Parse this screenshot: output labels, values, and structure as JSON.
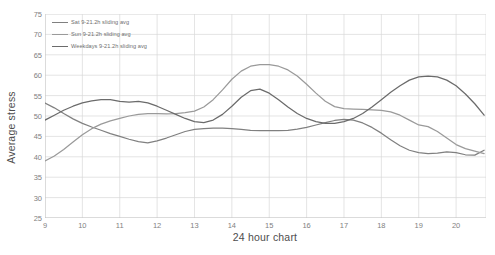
{
  "chart_data": {
    "type": "line",
    "title": "",
    "xlabel": "24 hour chart",
    "ylabel": "Average stress",
    "xlim": [
      9,
      20.8
    ],
    "ylim": [
      25,
      75
    ],
    "ytick_step": 5,
    "grid": true,
    "legend_position": "top-left-inside",
    "xticks": [
      "9",
      "10",
      "11",
      "12",
      "13",
      "14",
      "15",
      "16",
      "17",
      "18",
      "19",
      "20"
    ],
    "yticks": [
      "25",
      "30",
      "35",
      "40",
      "45",
      "50",
      "55",
      "60",
      "65",
      "70",
      "75"
    ],
    "x": [
      9,
      9.25,
      9.5,
      9.75,
      10,
      10.25,
      10.5,
      10.75,
      11,
      11.25,
      11.5,
      11.75,
      12,
      12.25,
      12.5,
      12.75,
      13,
      13.25,
      13.5,
      13.75,
      14,
      14.25,
      14.5,
      14.75,
      15,
      15.25,
      15.5,
      15.75,
      16,
      16.25,
      16.5,
      16.75,
      17,
      17.25,
      17.5,
      17.75,
      18,
      18.25,
      18.5,
      18.75,
      19,
      19.25,
      19.5,
      19.75,
      20,
      20.25,
      20.5,
      20.75
    ],
    "series": [
      {
        "name": "Sat 9-21.2h sliding avg",
        "color": "#808080",
        "values": [
          53.2,
          52.0,
          50.6,
          49.3,
          48.2,
          47.3,
          46.5,
          45.7,
          45.0,
          44.3,
          43.7,
          43.4,
          43.9,
          44.6,
          45.4,
          46.2,
          46.7,
          46.9,
          47.0,
          47.0,
          46.9,
          46.7,
          46.5,
          46.4,
          46.4,
          46.4,
          46.5,
          46.8,
          47.2,
          47.8,
          48.4,
          48.9,
          49.2,
          49.0,
          48.3,
          47.2,
          45.8,
          44.2,
          42.7,
          41.6,
          41.0,
          40.8,
          40.9,
          41.2,
          41.0,
          40.5,
          40.4,
          41.6
        ]
      },
      {
        "name": "Sun 9-21.2h sliding avg",
        "color": "#9a9a9a",
        "values": [
          39.0,
          40.2,
          41.8,
          43.6,
          45.4,
          46.9,
          48.0,
          48.8,
          49.4,
          50.0,
          50.4,
          50.6,
          50.6,
          50.5,
          50.6,
          50.8,
          51.2,
          52.2,
          54.0,
          56.4,
          59.0,
          61.0,
          62.2,
          62.6,
          62.6,
          62.2,
          61.3,
          59.8,
          57.8,
          55.6,
          53.6,
          52.3,
          51.8,
          51.7,
          51.6,
          51.5,
          51.4,
          51.0,
          50.2,
          49.0,
          47.8,
          47.4,
          46.2,
          44.6,
          43.0,
          42.0,
          41.4,
          40.8
        ]
      },
      {
        "name": "Weekdays 9-21.2h sliding avg",
        "color": "#6b6b6b",
        "values": [
          49.0,
          50.2,
          51.4,
          52.4,
          53.2,
          53.7,
          54.0,
          54.0,
          53.6,
          53.4,
          53.6,
          53.2,
          52.4,
          51.4,
          50.4,
          49.4,
          48.6,
          48.4,
          49.0,
          50.4,
          52.4,
          54.6,
          56.2,
          56.6,
          55.6,
          54.0,
          52.2,
          50.6,
          49.4,
          48.6,
          48.2,
          48.2,
          48.6,
          49.4,
          50.6,
          52.2,
          54.0,
          55.8,
          57.4,
          58.8,
          59.6,
          59.8,
          59.6,
          58.8,
          57.4,
          55.4,
          53.0,
          50.2
        ]
      }
    ]
  },
  "legend": {
    "items": [
      {
        "label": "Sat 9-21.2h sliding avg",
        "color": "#808080"
      },
      {
        "label": "Sun 9-21.2h sliding avg",
        "color": "#9a9a9a"
      },
      {
        "label": "Weekdays 9-21.2h sliding avg",
        "color": "#6b6b6b"
      }
    ]
  },
  "axes": {
    "x_title": "24 hour chart",
    "y_title": "Average stress"
  },
  "colors": {
    "grid": "#d9d9d9",
    "axis": "#bfbfbf",
    "tick_text": "#7f7f7f",
    "title_text": "#4d4d4d"
  }
}
